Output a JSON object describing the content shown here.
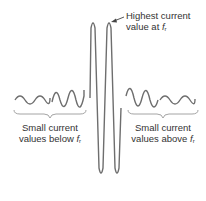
{
  "figure": {
    "annotation_top": {
      "line1": "Highest current",
      "line2_prefix": "value at ",
      "line2_symbol": "f",
      "line2_sub": "r"
    },
    "label_left": {
      "line1": "Small current",
      "line2_prefix": "values below ",
      "line2_symbol": "f",
      "line2_sub": "r"
    },
    "label_right": {
      "line1": "Small current",
      "line2_prefix": "values above ",
      "line2_symbol": "f",
      "line2_sub": "r"
    },
    "colors": {
      "waveform": "#6e6e6e",
      "brace": "#9a9a9a",
      "text": "#333333"
    }
  }
}
